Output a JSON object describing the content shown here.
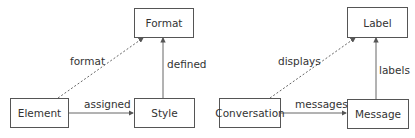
{
  "diagrams": [
    {
      "nodes": {
        "top": "Format",
        "left": "Element",
        "right": "Style"
      },
      "edges": {
        "dashed": "format",
        "horizontal": "assigned",
        "vertical": "defined"
      }
    },
    {
      "nodes": {
        "top": "Label",
        "left": "Conversation",
        "right": "Message"
      },
      "edges": {
        "dashed": "displays",
        "horizontal": "messages",
        "vertical": "labels"
      }
    }
  ],
  "colors": {
    "line": "#555555",
    "text": "#333333"
  }
}
